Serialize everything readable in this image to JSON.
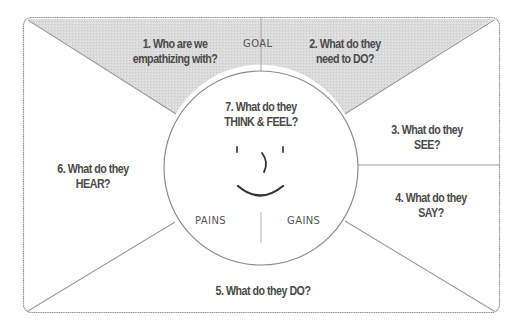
{
  "diagram": {
    "type": "empathy-map",
    "colors": {
      "frame_stroke": "#8c8c8c",
      "line_stroke": "#9a9a9a",
      "goal_fill": "#d9d9d9",
      "text": "#4a4a4a",
      "background": "#ffffff"
    },
    "goal_label": "GOAL",
    "pains_label": "PAINS",
    "gains_label": "GAINS",
    "sections": [
      {
        "id": 1,
        "line1": "1. Who are we",
        "line2": "empathizing with?"
      },
      {
        "id": 2,
        "line1": "2. What do they",
        "line2": "need to DO?"
      },
      {
        "id": 3,
        "line1": "3. What do they",
        "line2": "SEE?"
      },
      {
        "id": 4,
        "line1": "4. What do they",
        "line2": "SAY?"
      },
      {
        "id": 5,
        "line1": "5. What do they DO?",
        "line2": ""
      },
      {
        "id": 6,
        "line1": "6. What do they",
        "line2": "HEAR?"
      },
      {
        "id": 7,
        "line1": "7. What do they",
        "line2": "THINK & FEEL?"
      }
    ],
    "face": {
      "eyes": "' '",
      "nose": ")",
      "mouth": "smile"
    }
  }
}
